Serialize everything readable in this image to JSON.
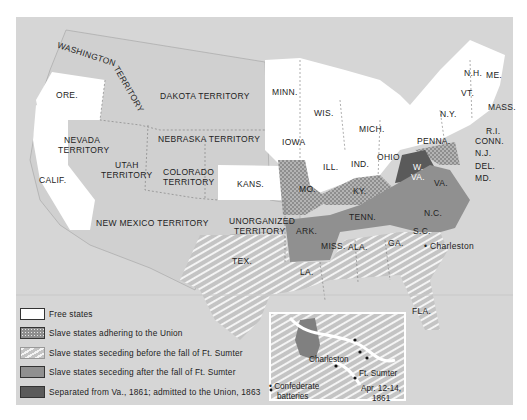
{
  "colors": {
    "background": "#d6d6d6",
    "free": "#ffffff",
    "union_slave": "#8e8e8e",
    "seceded_before": "#c9c9c9",
    "seceded_after": "#8f8f8f",
    "west_virginia": "#5a5a5a",
    "page": "#ffffff"
  },
  "map": {
    "labels": [
      {
        "id": "washington",
        "text": "WASHINGTON"
      },
      {
        "id": "washington2",
        "text": "TERRITORY"
      },
      {
        "id": "ore",
        "text": "ORE."
      },
      {
        "id": "dakota",
        "text": "DAKOTA TERRITORY"
      },
      {
        "id": "nevada",
        "text": "NEVADA"
      },
      {
        "id": "nevada2",
        "text": "TERRITORY"
      },
      {
        "id": "utah",
        "text": "UTAH"
      },
      {
        "id": "utah2",
        "text": "TERRITORY"
      },
      {
        "id": "nebraska",
        "text": "NEBRASKA TERRITORY"
      },
      {
        "id": "colorado",
        "text": "COLORADO"
      },
      {
        "id": "colorado2",
        "text": "TERRITORY"
      },
      {
        "id": "calif",
        "text": "CALIF."
      },
      {
        "id": "kans",
        "text": "KANS."
      },
      {
        "id": "newmexico",
        "text": "NEW MEXICO TERRITORY"
      },
      {
        "id": "unorg",
        "text": "UNORGANIZED"
      },
      {
        "id": "unorg2",
        "text": "TERRITORY"
      },
      {
        "id": "tex",
        "text": "TEX."
      },
      {
        "id": "minn",
        "text": "MINN."
      },
      {
        "id": "wis",
        "text": "WIS."
      },
      {
        "id": "iowa",
        "text": "IOWA"
      },
      {
        "id": "mich",
        "text": "MICH."
      },
      {
        "id": "ill",
        "text": "ILL."
      },
      {
        "id": "ind",
        "text": "IND."
      },
      {
        "id": "ohio",
        "text": "OHIO"
      },
      {
        "id": "mo",
        "text": "MO."
      },
      {
        "id": "ky",
        "text": "KY."
      },
      {
        "id": "penna",
        "text": "PENNA."
      },
      {
        "id": "ny",
        "text": "N.Y."
      },
      {
        "id": "vt",
        "text": "VT."
      },
      {
        "id": "nh",
        "text": "N.H."
      },
      {
        "id": "me",
        "text": "ME."
      },
      {
        "id": "mass",
        "text": "MASS."
      },
      {
        "id": "ri",
        "text": "R.I."
      },
      {
        "id": "conn",
        "text": "CONN."
      },
      {
        "id": "nj",
        "text": "N.J."
      },
      {
        "id": "del",
        "text": "DEL."
      },
      {
        "id": "md",
        "text": "MD."
      },
      {
        "id": "wva",
        "text": "W."
      },
      {
        "id": "wva2",
        "text": "VA."
      },
      {
        "id": "va",
        "text": "VA."
      },
      {
        "id": "nc",
        "text": "N.C."
      },
      {
        "id": "tenn",
        "text": "TENN."
      },
      {
        "id": "ark",
        "text": "ARK."
      },
      {
        "id": "miss",
        "text": "MISS."
      },
      {
        "id": "ala",
        "text": "ALA."
      },
      {
        "id": "ga",
        "text": "GA."
      },
      {
        "id": "sc",
        "text": "S.C."
      },
      {
        "id": "la",
        "text": "LA."
      },
      {
        "id": "fla",
        "text": "FLA."
      },
      {
        "id": "charleston",
        "text": "• Charleston"
      }
    ]
  },
  "legend": {
    "items": [
      {
        "label": "Free states"
      },
      {
        "label": "Slave states adhering to the Union"
      },
      {
        "label": "Slave states seceding before the fall of Ft. Sumter"
      },
      {
        "label": "Slave states seceding after the fall of Ft. Sumter"
      },
      {
        "label": "Separated from Va., 1861; admitted to the Union, 1863"
      }
    ]
  },
  "inset": {
    "charleston": "Charleston",
    "ft_sumter": "Ft. Sumter",
    "batteries_1": "• Confederate",
    "batteries_2": "batteries",
    "date_1": "Apr. 12-14,",
    "date_2": "1861"
  }
}
